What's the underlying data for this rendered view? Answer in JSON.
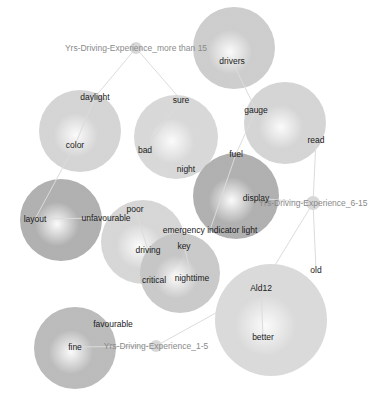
{
  "diagram": {
    "type": "bubble-network",
    "hubs": [
      {
        "id": "hub_more_than_15",
        "label": "Yrs-Driving-Experience_more than 15",
        "x": 136,
        "y": 48,
        "r": 6
      },
      {
        "id": "hub_6_15",
        "label": "Yrs-Driving-Experience_6-15",
        "x": 313,
        "y": 203,
        "r": 7
      },
      {
        "id": "hub_1_5",
        "label": "Yrs-Driving-Experience_1-5",
        "x": 156,
        "y": 346,
        "r": 6
      }
    ],
    "bubbles": [
      {
        "id": "b_drivers",
        "x": 234,
        "y": 48,
        "r": 41,
        "shade": "#c8c8c8"
      },
      {
        "id": "b_daylight",
        "x": 80,
        "y": 131,
        "r": 41,
        "shade": "#d0d0d0"
      },
      {
        "id": "b_sure",
        "x": 176,
        "y": 137,
        "r": 42,
        "shade": "#d4d4d4"
      },
      {
        "id": "b_gauge",
        "x": 285,
        "y": 123,
        "r": 41,
        "shade": "#d0d0d0"
      },
      {
        "id": "b_layout",
        "x": 61,
        "y": 220,
        "r": 41,
        "shade": "#a8a8a8"
      },
      {
        "id": "b_fuel",
        "x": 236,
        "y": 196,
        "r": 43,
        "shade": "#a8a8a8"
      },
      {
        "id": "b_poor",
        "x": 143,
        "y": 242,
        "r": 42,
        "shade": "#d2d2d2"
      },
      {
        "id": "b_key",
        "x": 180,
        "y": 273,
        "r": 40,
        "shade": "#c4c4c4"
      },
      {
        "id": "b_ald12",
        "x": 271,
        "y": 320,
        "r": 56,
        "shade": "#d6d6d6"
      },
      {
        "id": "b_fine",
        "x": 75,
        "y": 348,
        "r": 41,
        "shade": "#b4b4b4"
      }
    ],
    "words": [
      {
        "id": "w_drivers",
        "label": "drivers",
        "x": 232,
        "y": 64
      },
      {
        "id": "w_daylight",
        "label": "daylight",
        "x": 95,
        "y": 100
      },
      {
        "id": "w_color",
        "label": "color",
        "x": 75,
        "y": 148
      },
      {
        "id": "w_sure",
        "label": "sure",
        "x": 181,
        "y": 103
      },
      {
        "id": "w_bad",
        "label": "bad",
        "x": 145,
        "y": 153
      },
      {
        "id": "w_night",
        "label": "night",
        "x": 186,
        "y": 172
      },
      {
        "id": "w_gauge",
        "label": "gauge",
        "x": 256,
        "y": 113
      },
      {
        "id": "w_read",
        "label": "read",
        "x": 316,
        "y": 143
      },
      {
        "id": "w_fuel",
        "label": "fuel",
        "x": 236,
        "y": 157
      },
      {
        "id": "w_display",
        "label": "display",
        "x": 256,
        "y": 201
      },
      {
        "id": "w_layout",
        "label": "layout",
        "x": 35,
        "y": 222
      },
      {
        "id": "w_unfavourable",
        "label": "unfavourable",
        "x": 106,
        "y": 221
      },
      {
        "id": "w_poor",
        "label": "poor",
        "x": 135,
        "y": 212
      },
      {
        "id": "w_driving",
        "label": "driving",
        "x": 148,
        "y": 253
      },
      {
        "id": "w_emergency",
        "label": "emergency indicator light",
        "x": 210,
        "y": 233
      },
      {
        "id": "w_key",
        "label": "key",
        "x": 184,
        "y": 249
      },
      {
        "id": "w_critical",
        "label": "critical",
        "x": 154,
        "y": 283
      },
      {
        "id": "w_nighttime",
        "label": "nighttime",
        "x": 192,
        "y": 281
      },
      {
        "id": "w_old",
        "label": "old",
        "x": 316,
        "y": 273
      },
      {
        "id": "w_ald12",
        "label": "Ald12",
        "x": 261,
        "y": 291
      },
      {
        "id": "w_better",
        "label": "better",
        "x": 263,
        "y": 340
      },
      {
        "id": "w_favourable",
        "label": "favourable",
        "x": 113,
        "y": 327
      },
      {
        "id": "w_fine",
        "label": "fine",
        "x": 75,
        "y": 350
      }
    ],
    "edges": [
      [
        "hub_more_than_15",
        "w_daylight"
      ],
      [
        "hub_more_than_15",
        "w_sure"
      ],
      [
        "w_daylight",
        "w_color"
      ],
      [
        "w_color",
        "w_layout"
      ],
      [
        "w_sure",
        "w_bad"
      ],
      [
        "w_drivers",
        "w_gauge"
      ],
      [
        "w_gauge",
        "w_fuel"
      ],
      [
        "w_read",
        "hub_6_15"
      ],
      [
        "w_fuel",
        "w_emergency"
      ],
      [
        "w_display",
        "hub_6_15"
      ],
      [
        "hub_6_15",
        "w_old"
      ],
      [
        "hub_6_15",
        "w_ald12"
      ],
      [
        "w_poor",
        "w_driving"
      ],
      [
        "w_key",
        "w_nighttime"
      ],
      [
        "w_ald12",
        "w_better"
      ],
      [
        "w_ald12",
        "hub_1_5"
      ],
      [
        "w_fine",
        "hub_1_5"
      ],
      [
        "w_layout",
        "w_unfavourable"
      ]
    ],
    "colors": {
      "edge": "#dcdcdc",
      "hub_fill": "#d8d8d8",
      "word_text": "#1a1a1a",
      "hub_text": "#8a8a8a",
      "background": "#ffffff"
    }
  }
}
